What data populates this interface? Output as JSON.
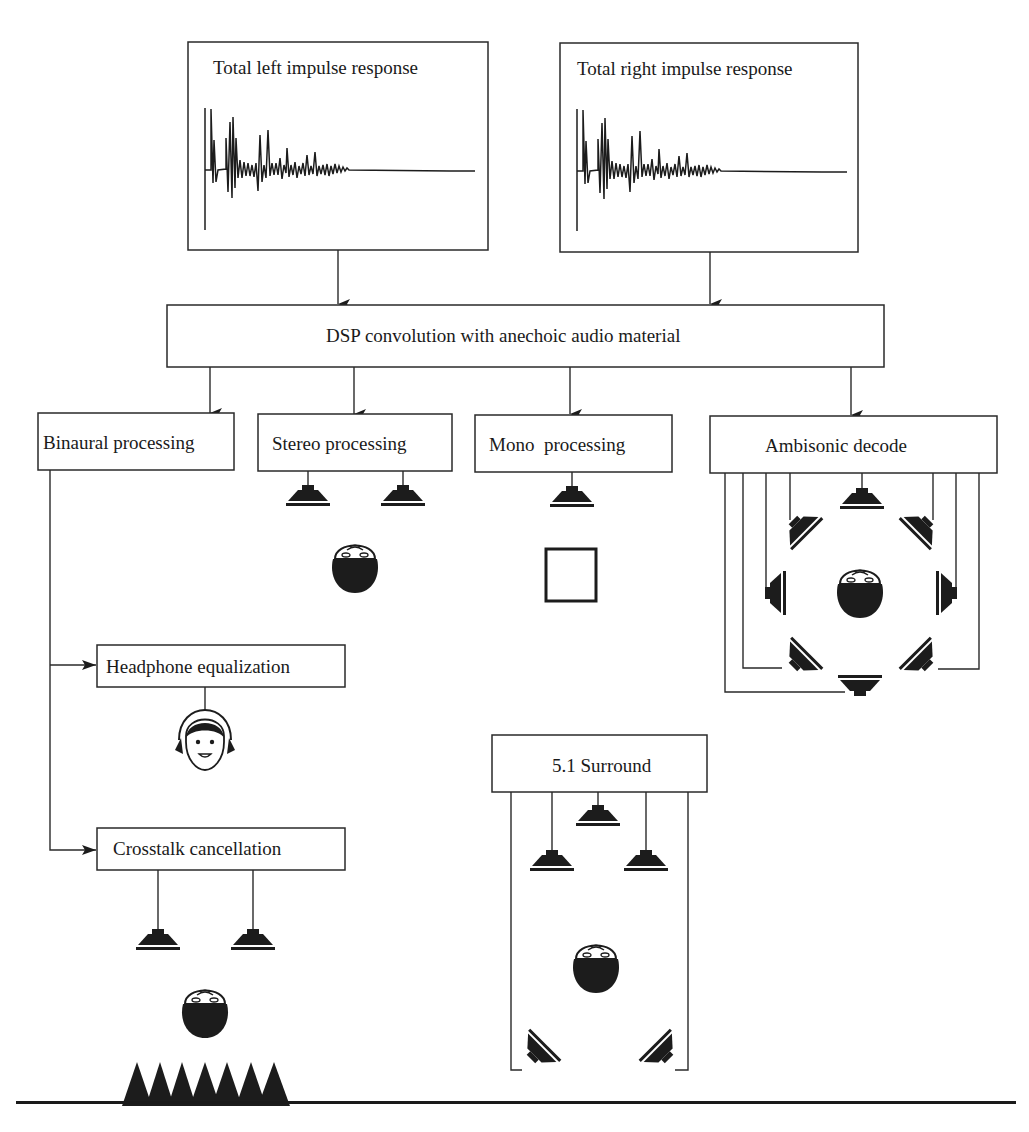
{
  "figure": {
    "impulse_left": {
      "title": "Total left impulse response"
    },
    "impulse_right": {
      "title": "Total right impulse response"
    },
    "dsp": {
      "label": "DSP convolution with anechoic audio material"
    },
    "outputs": {
      "binaural": {
        "label": "Binaural processing"
      },
      "stereo": {
        "label": "Stereo processing"
      },
      "mono": {
        "label": "Mono  processing"
      },
      "ambisonic": {
        "label": "Ambisonic decode"
      }
    },
    "binaural_branches": {
      "headphone": {
        "label": "Headphone equalization"
      },
      "crosstalk": {
        "label": "Crosstalk cancellation"
      }
    },
    "surround": {
      "label": "5.1 Surround"
    }
  },
  "icons": {
    "speaker": "speaker-icon",
    "listener_head": "listener-head-icon",
    "headphone_listener": "headphone-listener-icon",
    "mono_box": "mono-listening-box-icon",
    "absorber": "acoustic-absorber-icon"
  },
  "colors": {
    "ink": "#1c1c1c",
    "line": "#2a2a2a",
    "background": "#ffffff"
  }
}
